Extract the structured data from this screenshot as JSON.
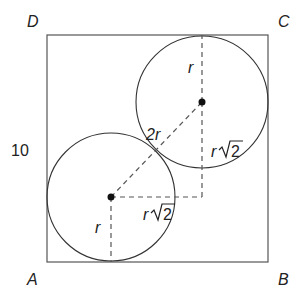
{
  "diagram": {
    "vertices": {
      "A": "A",
      "B": "B",
      "C": "C",
      "D": "D"
    },
    "side_label": "10",
    "labels": {
      "upper_radius": "r",
      "lower_radius": "r",
      "center_distance": "2r",
      "vertical_leg": "r",
      "horizontal_leg": "r",
      "sqrt_two": "2"
    },
    "colors": {
      "stroke": "#333333",
      "dash": "#555555",
      "text": "#222222"
    }
  }
}
